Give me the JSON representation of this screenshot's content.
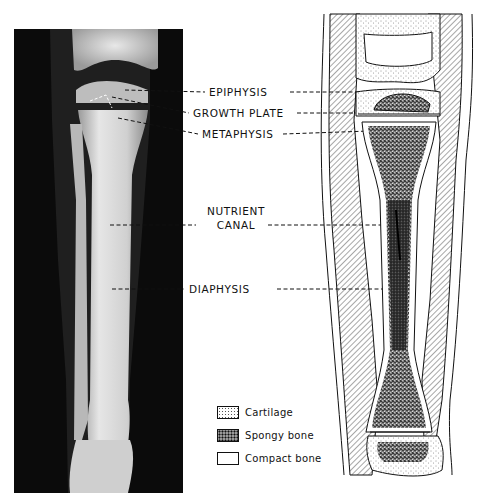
{
  "figure": {
    "left_panel": "X-ray radiograph of a child's knee and lower leg (tibia and fibula)",
    "right_panel": "Schematic drawing of tibia longitudinal section within the leg"
  },
  "labels": {
    "epiphysis": "EPIPHYSIS",
    "growth_plate": "GROWTH PLATE",
    "metaphysis": "METAPHYSIS",
    "nutrient_line1": "NUTRIENT",
    "nutrient_line2": "CANAL",
    "diaphysis": "DIAPHYSIS"
  },
  "legend": {
    "items": [
      {
        "label": "Cartilage",
        "pattern": "fine-stipple"
      },
      {
        "label": "Spongy bone",
        "pattern": "coarse-stipple"
      },
      {
        "label": "Compact bone",
        "pattern": "blank"
      }
    ]
  },
  "colors": {
    "ink": "#111111",
    "xray_bg": "#0b0b0b",
    "bone_light": "#e8e8e8",
    "paper": "#ffffff"
  }
}
